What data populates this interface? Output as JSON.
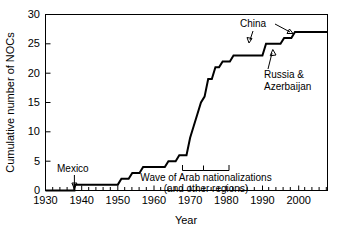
{
  "chart_data": {
    "type": "line",
    "title": "",
    "xlabel": "Year",
    "ylabel": "Cumulative number of NOCs",
    "xlim": [
      1930,
      2008
    ],
    "ylim": [
      0,
      30
    ],
    "grid": false,
    "legend": "none",
    "x_ticks": [
      1930,
      1940,
      1950,
      1960,
      1970,
      1980,
      1990,
      2000
    ],
    "x_tick_labels": [
      "1930",
      "1940",
      "1950",
      "1960",
      "1970",
      "1980",
      "1990",
      "2000"
    ],
    "x_minor_tick_step": 2,
    "y_ticks": [
      0,
      5,
      10,
      15,
      20,
      25,
      30
    ],
    "y_tick_labels": [
      "0",
      "5",
      "10",
      "15",
      "20",
      "25",
      "30"
    ],
    "series": [
      {
        "name": "Cumulative number of NOCs",
        "step": "post",
        "points": [
          {
            "x": 1930,
            "y": 0
          },
          {
            "x": 1938,
            "y": 0
          },
          {
            "x": 1938,
            "y": 1
          },
          {
            "x": 1950,
            "y": 1
          },
          {
            "x": 1951,
            "y": 2
          },
          {
            "x": 1953,
            "y": 2
          },
          {
            "x": 1954,
            "y": 3
          },
          {
            "x": 1956,
            "y": 3
          },
          {
            "x": 1957,
            "y": 4
          },
          {
            "x": 1963,
            "y": 4
          },
          {
            "x": 1964,
            "y": 5
          },
          {
            "x": 1966,
            "y": 5
          },
          {
            "x": 1967,
            "y": 6
          },
          {
            "x": 1968,
            "y": 6
          },
          {
            "x": 1969,
            "y": 6
          },
          {
            "x": 1970,
            "y": 9
          },
          {
            "x": 1971,
            "y": 11
          },
          {
            "x": 1972,
            "y": 13
          },
          {
            "x": 1973,
            "y": 15
          },
          {
            "x": 1974,
            "y": 16
          },
          {
            "x": 1975,
            "y": 19
          },
          {
            "x": 1976,
            "y": 19
          },
          {
            "x": 1977,
            "y": 21
          },
          {
            "x": 1978,
            "y": 21
          },
          {
            "x": 1979,
            "y": 22
          },
          {
            "x": 1981,
            "y": 22
          },
          {
            "x": 1982,
            "y": 23
          },
          {
            "x": 1990,
            "y": 23
          },
          {
            "x": 1991,
            "y": 25
          },
          {
            "x": 1995,
            "y": 25
          },
          {
            "x": 1996,
            "y": 26
          },
          {
            "x": 1998,
            "y": 26
          },
          {
            "x": 1999,
            "y": 27
          },
          {
            "x": 2008,
            "y": 27
          }
        ]
      }
    ],
    "annotations": [
      {
        "name": "mexico",
        "text": "Mexico",
        "target_x": 1938,
        "target_y": 1
      },
      {
        "name": "china",
        "text": "China",
        "target_x": 1996,
        "target_y": 26
      },
      {
        "name": "russia-azerbaijan",
        "text": "Russia &\nAzerbaijan",
        "line1": "Russia &",
        "line2": "Azerbaijan",
        "target_x": 1991,
        "target_y": 25
      },
      {
        "name": "arab-nationalizations",
        "line1": "Wave of Arab nationalizations",
        "line2": "(and other regions)",
        "bracket_from_x": 1968,
        "bracket_to_x": 1982
      }
    ]
  }
}
